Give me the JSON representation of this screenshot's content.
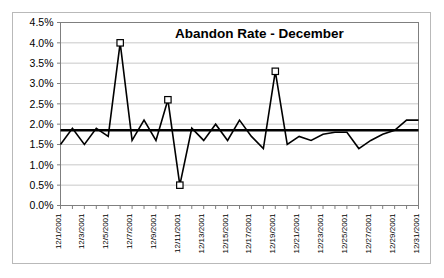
{
  "chart_data": {
    "type": "line",
    "title": "Abandon Rate - December",
    "xlabel": "",
    "ylabel": "",
    "ylim": [
      0.0,
      4.5
    ],
    "ytick_values": [
      0.0,
      0.5,
      1.0,
      1.5,
      2.0,
      2.5,
      3.0,
      3.5,
      4.0,
      4.5
    ],
    "ytick_labels": [
      "0.0%",
      "0.5%",
      "1.0%",
      "1.5%",
      "2.0%",
      "2.5%",
      "3.0%",
      "3.5%",
      "4.0%",
      "4.5%"
    ],
    "grid": true,
    "legend": "none",
    "x": [
      "12/1/2001",
      "12/2/2001",
      "12/3/2001",
      "12/4/2001",
      "12/5/2001",
      "12/6/2001",
      "12/7/2001",
      "12/8/2001",
      "12/9/2001",
      "12/10/2001",
      "12/11/2001",
      "12/12/2001",
      "12/13/2001",
      "12/14/2001",
      "12/15/2001",
      "12/16/2001",
      "12/17/2001",
      "12/18/2001",
      "12/19/2001",
      "12/20/2001",
      "12/21/2001",
      "12/22/2001",
      "12/23/2001",
      "12/24/2001",
      "12/25/2001",
      "12/26/2001",
      "12/27/2001",
      "12/28/2001",
      "12/29/2001",
      "12/30/2001",
      "12/31/2001"
    ],
    "xtick_labels": [
      "12/1/2001",
      "12/3/2001",
      "12/5/2001",
      "12/7/2001",
      "12/9/2001",
      "12/11/2001",
      "12/13/2001",
      "12/15/2001",
      "12/17/2001",
      "12/19/2001",
      "12/21/2001",
      "12/23/2001",
      "12/25/2001",
      "12/27/2001",
      "12/29/2001",
      "12/31/2001"
    ],
    "xtick_indices": [
      0,
      2,
      4,
      6,
      8,
      10,
      12,
      14,
      16,
      18,
      20,
      22,
      24,
      26,
      28,
      30
    ],
    "series": [
      {
        "name": "Abandon Rate",
        "color": "#000000",
        "values": [
          1.5,
          1.9,
          1.5,
          1.9,
          1.7,
          4.0,
          1.6,
          2.1,
          1.6,
          2.6,
          0.5,
          1.9,
          1.6,
          2.0,
          1.6,
          2.1,
          1.7,
          1.4,
          3.3,
          1.5,
          1.7,
          1.6,
          1.75,
          1.8,
          1.8,
          1.4,
          1.6,
          1.75,
          1.85,
          2.1,
          2.1
        ],
        "marker_indices": [
          5,
          9,
          10,
          18
        ],
        "marker_values": [
          4.0,
          2.6,
          0.5,
          3.3
        ],
        "marker_shape": "open-square"
      },
      {
        "name": "Average",
        "type": "reference-line",
        "color": "#000000",
        "value": 1.85
      }
    ]
  }
}
